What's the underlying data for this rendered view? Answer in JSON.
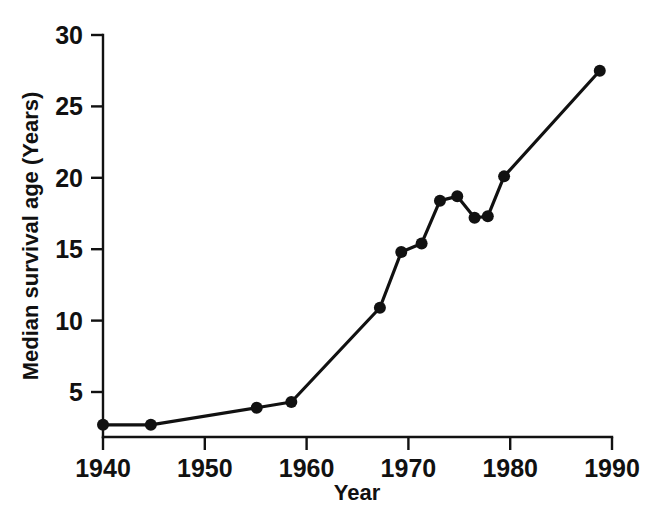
{
  "chart_data": {
    "type": "line",
    "title": "",
    "xlabel": "Year",
    "ylabel": "Median survival age (Years)",
    "xlim": [
      1940,
      1990
    ],
    "ylim": [
      0,
      30
    ],
    "grid": false,
    "legend": null,
    "x_ticks": [
      1940,
      1950,
      1960,
      1970,
      1980,
      1990
    ],
    "x_tick_labels": [
      "1940",
      "1950",
      "1960",
      "1970",
      "1980",
      "1990"
    ],
    "y_ticks": [
      5,
      10,
      15,
      20,
      25,
      30
    ],
    "y_tick_labels": [
      "5",
      "10",
      "15",
      "20",
      "25",
      "30"
    ],
    "marker": "filled-circle",
    "line_color": "#111111",
    "marker_color": "#111111",
    "background_color": "#ffffff",
    "series": [
      {
        "name": "Median survival age",
        "points": [
          {
            "x": 1940.0,
            "y": 2.7
          },
          {
            "x": 1944.7,
            "y": 2.7
          },
          {
            "x": 1955.1,
            "y": 3.9
          },
          {
            "x": 1958.5,
            "y": 4.3
          },
          {
            "x": 1967.2,
            "y": 10.9
          },
          {
            "x": 1969.3,
            "y": 14.8
          },
          {
            "x": 1971.3,
            "y": 15.4
          },
          {
            "x": 1973.1,
            "y": 18.4
          },
          {
            "x": 1974.8,
            "y": 18.7
          },
          {
            "x": 1976.5,
            "y": 17.2
          },
          {
            "x": 1977.8,
            "y": 17.3
          },
          {
            "x": 1979.4,
            "y": 20.1
          },
          {
            "x": 1988.8,
            "y": 27.5
          }
        ]
      }
    ]
  },
  "axis_titles": {
    "x": "Year",
    "y": "Median survival age (Years)"
  }
}
